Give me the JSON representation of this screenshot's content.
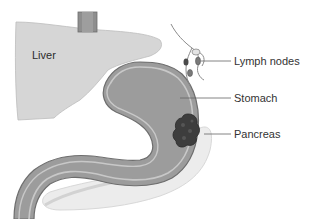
{
  "diagram": {
    "type": "anatomical-illustration",
    "labels": {
      "liver": "Liver",
      "lymph_nodes": "Lymph nodes",
      "stomach": "Stomach",
      "pancreas": "Pancreas"
    },
    "colors": {
      "liver": "#d6d6d6",
      "stomach": "#9c9c9c",
      "stomach_border": "#c8c8c8",
      "stomach_outline": "#6e6e6e",
      "tumor": "#3d3d3d",
      "pancreas": "#ececec",
      "lymph_node": "#7a7a7a",
      "leader_line": "#666666",
      "label_text": "#333333"
    }
  }
}
